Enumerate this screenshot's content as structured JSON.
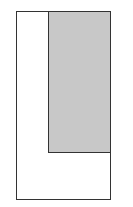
{
  "diagram": {
    "outer_rect": {
      "fill": "#ffffff",
      "stroke": "#333333"
    },
    "inner_rect": {
      "fill": "#c8c8c8",
      "stroke": "#333333"
    }
  }
}
